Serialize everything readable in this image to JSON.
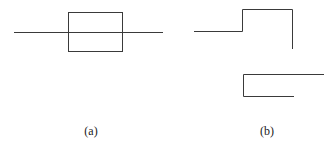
{
  "figure": {
    "panels": [
      {
        "label": "(a)",
        "label_pos": [
          91,
          124
        ],
        "description": "horizontal line passing through a rectangle",
        "lines": [
          [
            14,
            32,
            163,
            32
          ]
        ],
        "rect": {
          "x": 68,
          "y": 12,
          "w": 54,
          "h": 39
        }
      },
      {
        "label": "(b)",
        "label_pos": [
          267,
          124
        ],
        "description": "two stepped open polylines",
        "polylines": [
          [
            [
              194,
              31
            ],
            [
              242,
              31
            ],
            [
              242,
              9
            ],
            [
              292,
              9
            ],
            [
              292,
              49
            ]
          ],
          [
            [
              324,
              74
            ],
            [
              243,
              74
            ],
            [
              243,
              96
            ],
            [
              294,
              96
            ]
          ]
        ]
      }
    ],
    "stroke_color": "#3a3a3a"
  }
}
